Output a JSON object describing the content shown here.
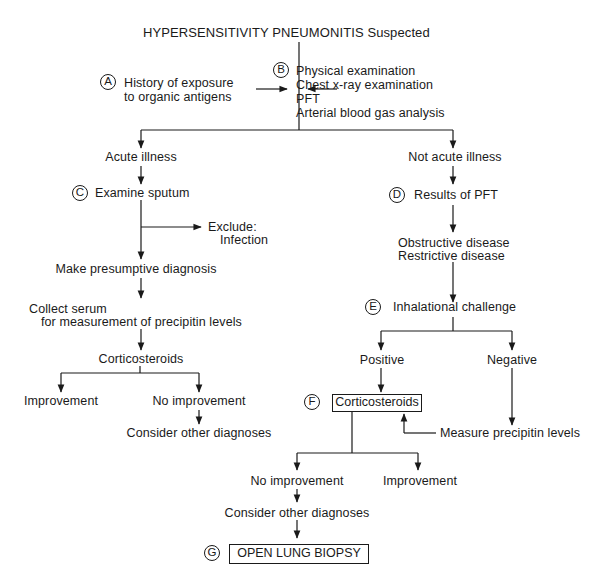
{
  "title": "HYPERSENSITIVITY PNEUMONITIS Suspected",
  "steps": {
    "A": {
      "label": "A",
      "lines": [
        "History of exposure",
        "to organic antigens"
      ]
    },
    "B": {
      "label": "B",
      "lines": [
        "Physical examination",
        "Chest x-ray examination",
        "PFT",
        "Arterial blood gas analysis"
      ]
    },
    "C": {
      "label": "C",
      "text": "Examine sputum"
    },
    "D": {
      "label": "D",
      "text": "Results of PFT"
    },
    "E": {
      "label": "E",
      "text": "Inhalational challenge"
    },
    "F": {
      "label": "F",
      "text": "Corticosteroids"
    },
    "G": {
      "label": "G",
      "text": "OPEN LUNG BIOPSY"
    }
  },
  "left_branch": {
    "header": "Acute illness",
    "exclude": [
      "Exclude:",
      "Infection"
    ],
    "presumptive": "Make presumptive diagnosis",
    "serum": [
      "Collect serum",
      "for measurement of precipitin levels"
    ],
    "corticosteroids": "Corticosteroids",
    "improvement": "Improvement",
    "no_improvement": "No improvement",
    "consider": "Consider other diagnoses"
  },
  "right_branch": {
    "header": "Not acute illness",
    "pft_results": [
      "Obstructive disease",
      "Restrictive disease"
    ],
    "positive": "Positive",
    "negative": "Negative",
    "measure": "Measure precipitin levels",
    "no_improvement": "No improvement",
    "improvement": "Improvement",
    "consider": "Consider other diagnoses"
  }
}
